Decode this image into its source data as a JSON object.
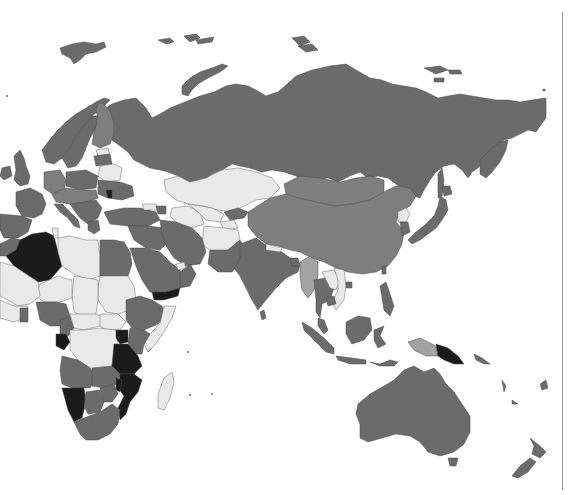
{
  "map": {
    "type": "choropleth",
    "projection": "eastern-hemisphere",
    "color_scale": {
      "black": "#1b1b1b",
      "dark": "#6b6b6b",
      "mid": "#7e7e7e",
      "midlight": "#a3a3a3",
      "light": "#e9e9e9",
      "water": "#ffffff"
    },
    "regions": [
      {
        "name": "Russia",
        "class": "dark"
      },
      {
        "name": "Kazakhstan",
        "class": "light"
      },
      {
        "name": "Uzbekistan",
        "class": "light"
      },
      {
        "name": "Turkmenistan",
        "class": "light"
      },
      {
        "name": "Kyrgyzstan",
        "class": "dark"
      },
      {
        "name": "Tajikistan",
        "class": "light"
      },
      {
        "name": "Afghanistan",
        "class": "light"
      },
      {
        "name": "Mongolia",
        "class": "mid"
      },
      {
        "name": "China",
        "class": "mid"
      },
      {
        "name": "India",
        "class": "dark"
      },
      {
        "name": "Pakistan",
        "class": "dark"
      },
      {
        "name": "Iran",
        "class": "dark"
      },
      {
        "name": "Myanmar",
        "class": "midlight"
      },
      {
        "name": "Thailand",
        "class": "dark"
      },
      {
        "name": "Laos",
        "class": "light"
      },
      {
        "name": "Vietnam",
        "class": "light"
      },
      {
        "name": "North Korea",
        "class": "light"
      },
      {
        "name": "South Korea",
        "class": "dark"
      },
      {
        "name": "Japan",
        "class": "dark"
      },
      {
        "name": "Indonesia",
        "class": "dark"
      },
      {
        "name": "Philippines",
        "class": "dark"
      },
      {
        "name": "Papua New Guinea",
        "class": "black"
      },
      {
        "name": "Australia",
        "class": "dark"
      },
      {
        "name": "New Zealand",
        "class": "dark"
      },
      {
        "name": "Saudi Arabia",
        "class": "dark"
      },
      {
        "name": "Yemen",
        "class": "black"
      },
      {
        "name": "Oman",
        "class": "dark"
      },
      {
        "name": "Turkey",
        "class": "dark"
      },
      {
        "name": "Egypt",
        "class": "dark"
      },
      {
        "name": "Libya",
        "class": "light"
      },
      {
        "name": "Algeria",
        "class": "black"
      },
      {
        "name": "Morocco",
        "class": "dark"
      },
      {
        "name": "Mali",
        "class": "light"
      },
      {
        "name": "Niger",
        "class": "light"
      },
      {
        "name": "Chad",
        "class": "light"
      },
      {
        "name": "Sudan",
        "class": "light"
      },
      {
        "name": "Nigeria",
        "class": "dark"
      },
      {
        "name": "Ethiopia",
        "class": "dark"
      },
      {
        "name": "Somalia",
        "class": "light"
      },
      {
        "name": "Kenya",
        "class": "dark"
      },
      {
        "name": "DR Congo",
        "class": "light"
      },
      {
        "name": "Gabon",
        "class": "black"
      },
      {
        "name": "Uganda",
        "class": "black"
      },
      {
        "name": "Tanzania",
        "class": "black"
      },
      {
        "name": "Mozambique",
        "class": "black"
      },
      {
        "name": "Angola",
        "class": "dark"
      },
      {
        "name": "Zambia",
        "class": "dark"
      },
      {
        "name": "Namibia",
        "class": "black"
      },
      {
        "name": "Botswana",
        "class": "dark"
      },
      {
        "name": "Zimbabwe",
        "class": "dark"
      },
      {
        "name": "South Africa",
        "class": "dark"
      },
      {
        "name": "Madagascar",
        "class": "light"
      },
      {
        "name": "Belarus",
        "class": "light"
      },
      {
        "name": "Finland",
        "class": "mid"
      },
      {
        "name": "Norway",
        "class": "dark"
      },
      {
        "name": "Sweden",
        "class": "dark"
      },
      {
        "name": "Germany",
        "class": "mid"
      },
      {
        "name": "France",
        "class": "dark"
      },
      {
        "name": "Spain",
        "class": "dark"
      },
      {
        "name": "Italy",
        "class": "dark"
      },
      {
        "name": "United Kingdom",
        "class": "dark"
      },
      {
        "name": "Moldova",
        "class": "black"
      }
    ]
  }
}
